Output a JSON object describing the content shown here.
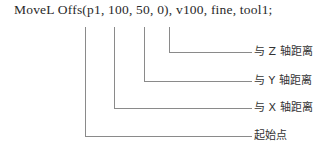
{
  "code_line": "MoveL Offs(p1, 100, 50, 0), v100, fine, tool1;",
  "annotations": [
    {
      "label": "与 Z 轴距离",
      "target": "0"
    },
    {
      "label": "与 Y 轴距离",
      "target": "50"
    },
    {
      "label": "与 X 轴距离",
      "target": "100"
    },
    {
      "label": "起始点",
      "target": "p1"
    }
  ]
}
